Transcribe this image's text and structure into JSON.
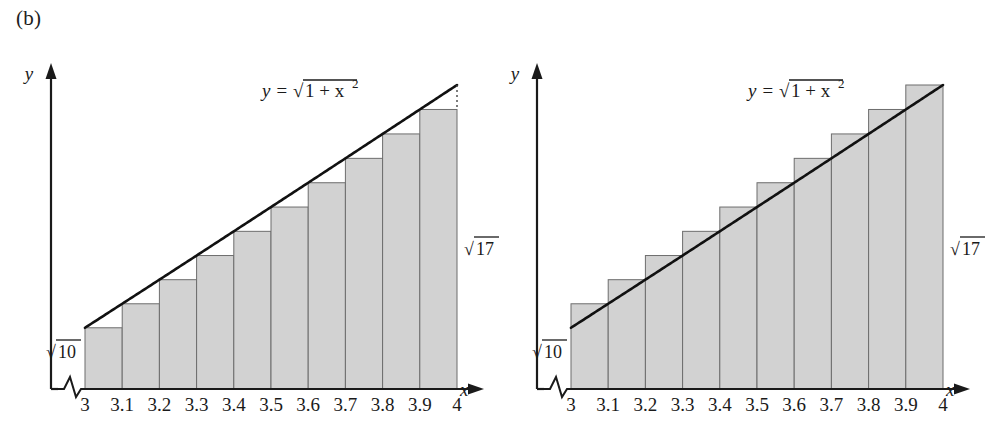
{
  "figure": {
    "panel_label": "(b)",
    "background_color": "#ffffff",
    "bar_fill_color": "#d2d2d2",
    "bar_stroke_color": "#6d6d6d",
    "curve_color": "#111111",
    "axis_color": "#1a1a1a"
  },
  "chart_data": [
    {
      "type": "bar",
      "id": "left-panel-lower-sums",
      "title": "",
      "subtitle": "",
      "xlabel": "x",
      "ylabel": "y",
      "curve_label": "y = √(1 + x²)",
      "curve_expression": "y = sqrt(1 + x^2)",
      "rectangle_rule": "left endpoint (lower sum)",
      "axis_break": true,
      "grid": false,
      "legend": "none",
      "xlim": [
        3,
        4
      ],
      "ylim": [
        0,
        4.1231
      ],
      "categories": [
        "3",
        "3.1",
        "3.2",
        "3.3",
        "3.4",
        "3.5",
        "3.6",
        "3.7",
        "3.8",
        "3.9",
        "4"
      ],
      "xticks": [
        3,
        3.1,
        3.2,
        3.3,
        3.4,
        3.5,
        3.6,
        3.7,
        3.8,
        3.9,
        4
      ],
      "xtick_labels": [
        "3",
        "3.1",
        "3.2",
        "3.3",
        "3.4",
        "3.5",
        "3.6",
        "3.7",
        "3.8",
        "3.9",
        "4"
      ],
      "bar_left_edges": [
        3.0,
        3.1,
        3.2,
        3.3,
        3.4,
        3.5,
        3.6,
        3.7,
        3.8,
        3.9
      ],
      "bar_width": 0.1,
      "values": [
        3.1623,
        3.2573,
        3.3526,
        3.4482,
        3.544,
        3.6401,
        3.7363,
        3.8328,
        3.9294,
        4.0262
      ],
      "annotations": [
        {
          "name": "y-start-value",
          "text": "√10",
          "at_x": 3.0,
          "value": 3.1623
        },
        {
          "name": "y-end-value",
          "text": "√17",
          "at_x": 4.0,
          "value": 4.1231
        }
      ],
      "dotted_drop_line": {
        "at_x": 4.0,
        "from": 4.1231,
        "to": 4.0262
      }
    },
    {
      "type": "bar",
      "id": "right-panel-upper-sums",
      "title": "",
      "subtitle": "",
      "xlabel": "x",
      "ylabel": "y",
      "curve_label": "y = √(1 + x²)",
      "curve_expression": "y = sqrt(1 + x^2)",
      "rectangle_rule": "right endpoint (upper sum)",
      "axis_break": true,
      "grid": false,
      "legend": "none",
      "xlim": [
        3,
        4
      ],
      "ylim": [
        0,
        4.1231
      ],
      "categories": [
        "3",
        "3.1",
        "3.2",
        "3.3",
        "3.4",
        "3.5",
        "3.6",
        "3.7",
        "3.8",
        "3.9",
        "4"
      ],
      "xticks": [
        3,
        3.1,
        3.2,
        3.3,
        3.4,
        3.5,
        3.6,
        3.7,
        3.8,
        3.9,
        4
      ],
      "xtick_labels": [
        "3",
        "3.1",
        "3.2",
        "3.3",
        "3.4",
        "3.5",
        "3.6",
        "3.7",
        "3.8",
        "3.9",
        "4"
      ],
      "bar_left_edges": [
        3.0,
        3.1,
        3.2,
        3.3,
        3.4,
        3.5,
        3.6,
        3.7,
        3.8,
        3.9
      ],
      "bar_width": 0.1,
      "values": [
        3.2573,
        3.3526,
        3.4482,
        3.544,
        3.6401,
        3.7363,
        3.8328,
        3.9294,
        4.0262,
        4.1231
      ],
      "annotations": [
        {
          "name": "y-start-value",
          "text": "√10",
          "at_x": 3.0,
          "value": 3.1623
        },
        {
          "name": "y-end-value",
          "text": "√17",
          "at_x": 4.0,
          "value": 4.1231
        }
      ]
    }
  ],
  "left_chart": {
    "y_axis_label": "y",
    "x_axis_label": "x",
    "formula": "y =",
    "formula_radicand": "1 + x",
    "formula_exponent": "2",
    "sqrt_start": "10",
    "sqrt_end": "17",
    "radical_glyph": "√",
    "ticks": [
      "3",
      "3.1",
      "3.2",
      "3.3",
      "3.4",
      "3.5",
      "3.6",
      "3.7",
      "3.8",
      "3.9",
      "4"
    ]
  },
  "right_chart": {
    "y_axis_label": "y",
    "x_axis_label": "x",
    "formula": "y =",
    "formula_radicand": "1 + x",
    "formula_exponent": "2",
    "sqrt_start": "10",
    "sqrt_end": "17",
    "radical_glyph": "√",
    "ticks": [
      "3",
      "3.1",
      "3.2",
      "3.3",
      "3.4",
      "3.5",
      "3.6",
      "3.7",
      "3.8",
      "3.9",
      "4"
    ]
  }
}
